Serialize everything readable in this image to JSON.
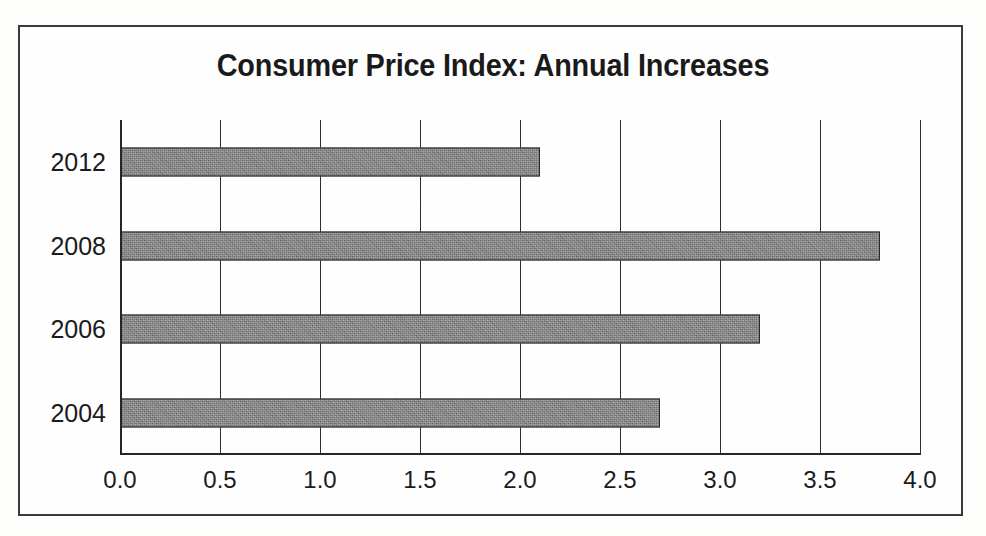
{
  "chart_data": {
    "type": "bar",
    "orientation": "horizontal",
    "title": "Consumer Price Index: Annual Increases",
    "xlabel": "",
    "ylabel": "",
    "categories": [
      "2012",
      "2008",
      "2006",
      "2004"
    ],
    "values": [
      2.1,
      3.8,
      3.2,
      2.7
    ],
    "xlim": [
      0.0,
      4.0
    ],
    "xticks": [
      0.0,
      0.5,
      1.0,
      1.5,
      2.0,
      2.5,
      3.0,
      3.5,
      4.0
    ],
    "xtick_labels": [
      "0.0",
      "0.5",
      "1.0",
      "1.5",
      "2.0",
      "2.5",
      "3.0",
      "3.5",
      "4.0"
    ],
    "grid": "vertical",
    "legend": null,
    "bar_color": "#6f6f6f",
    "bar_edge_color": "#2b2b2b",
    "axis_color": "#262626",
    "background_color": "#fefefe",
    "series": [
      {
        "name": "Annual Increase (%)",
        "points": [
          {
            "category": "2012",
            "value": 2.1
          },
          {
            "category": "2008",
            "value": 3.8
          },
          {
            "category": "2006",
            "value": 3.2
          },
          {
            "category": "2004",
            "value": 2.7
          }
        ]
      }
    ]
  }
}
